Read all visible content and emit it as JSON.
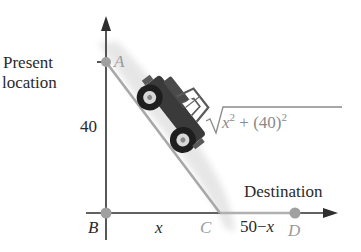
{
  "diagram": {
    "labels": {
      "present_line1": "Present",
      "present_line2": "location",
      "destination": "Destination",
      "vertical_length": "40",
      "segment_bc": "x",
      "segment_cd_prefix": "50−",
      "segment_cd_var": "x"
    },
    "points": {
      "A": {
        "label": "A",
        "x": 106,
        "y": 62
      },
      "B": {
        "label": "B",
        "x": 106,
        "y": 213
      },
      "C": {
        "label": "C",
        "x": 220,
        "y": 213
      },
      "D": {
        "label": "D",
        "x": 295,
        "y": 213
      }
    },
    "formula": {
      "radical_symbol": "√",
      "var": "x",
      "exp1": "2",
      "plus": " + (40)",
      "exp2": "2"
    },
    "icons": {
      "vehicle": "off-road-jeep-icon"
    },
    "colors": {
      "axis": "#2e2e2e",
      "path": "#a8a8a8",
      "shadow": "#e2e2e2",
      "point": "#9c9c9c",
      "label_text": "#2a2a2a",
      "point_label": "#9a9a9a",
      "vehicle_body": "#3a3a3a"
    }
  }
}
